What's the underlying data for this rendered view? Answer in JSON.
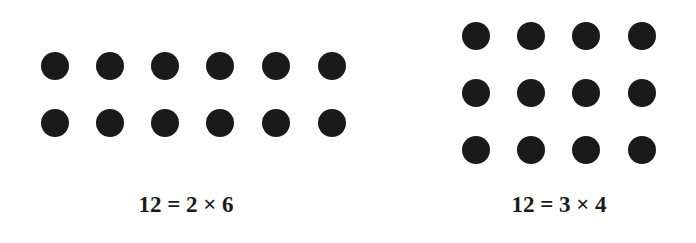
{
  "figure": {
    "title": "",
    "dot_color": "#1a1a1a",
    "background": "#ffffff",
    "arrays": [
      {
        "name": "2x6-array",
        "rows": 2,
        "cols": 6,
        "col_x": [
          55,
          110,
          165,
          220,
          276,
          332
        ],
        "row_y": [
          66,
          123
        ],
        "label": "12 = 2 × 6",
        "label_pos": [
          186,
          205
        ]
      },
      {
        "name": "3x4-array",
        "rows": 3,
        "cols": 4,
        "col_x": [
          476,
          531,
          586,
          642
        ],
        "row_y": [
          36,
          93,
          150
        ],
        "label": "12 = 3 × 4",
        "label_pos": [
          559,
          205
        ]
      }
    ]
  }
}
